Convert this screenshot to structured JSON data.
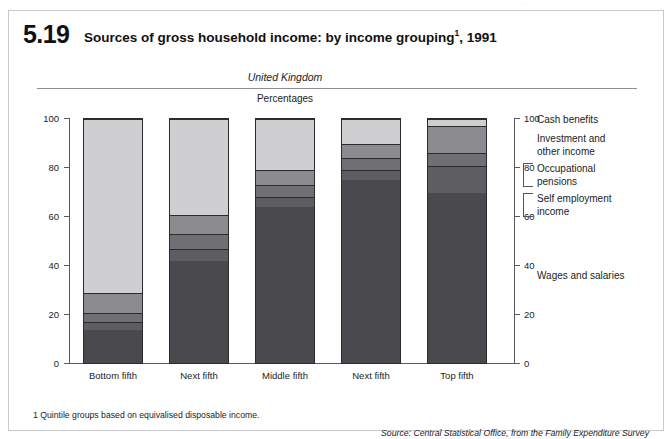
{
  "figure": {
    "number": "5.19",
    "title_main": "Sources of gross household income: by income grouping",
    "title_footnote_marker": "1",
    "title_year": ", 1991",
    "region": "United Kingdom",
    "units": "Percentages",
    "footnote": "1  Quintile groups based on equivalised disposable income.",
    "source": "Source: Central Statistical Office, from the Family Expenditure Survey"
  },
  "legend": {
    "items": [
      {
        "key": "cash_benefits",
        "label": "Cash benefits"
      },
      {
        "key": "investment_other",
        "label": "Investment and\nother income",
        "line1": "Investment and",
        "line2": "other income"
      },
      {
        "key": "occupational_pensions",
        "label": "Occupational\npensions",
        "line1": "Occupational",
        "line2": "pensions"
      },
      {
        "key": "self_employment",
        "label": "Self employment\nincome",
        "line1": "Self employment",
        "line2": "income"
      },
      {
        "key": "wages_salaries",
        "label": "Wages and salaries"
      }
    ]
  },
  "axis": {
    "y_ticks": [
      "0",
      "20",
      "40",
      "60",
      "80",
      "100"
    ],
    "y_min": 0,
    "y_max": 100
  },
  "chart_data": {
    "type": "bar",
    "subtype": "stacked-vertical-100pct",
    "subtitle": "United Kingdom",
    "xlabel": "",
    "ylabel": "Percentages",
    "ylim": [
      0,
      100
    ],
    "yticks": [
      0,
      20,
      40,
      60,
      80,
      100
    ],
    "grid": false,
    "legend_position": "right",
    "categories": [
      "Bottom fifth",
      "Next fifth",
      "Middle fifth",
      "Next fifth",
      "Top fifth"
    ],
    "series": [
      {
        "name": "Wages and salaries",
        "color": "#4a4a4e",
        "values": [
          14,
          42,
          64,
          75,
          70
        ]
      },
      {
        "name": "Self employment income",
        "color": "#5e5e62",
        "values": [
          3,
          5,
          4,
          4,
          11
        ]
      },
      {
        "name": "Occupational pensions",
        "color": "#6f6f74",
        "values": [
          4,
          6,
          5,
          5,
          5
        ]
      },
      {
        "name": "Investment and other income",
        "color": "#8b8b90",
        "values": [
          8,
          8,
          6,
          6,
          11
        ]
      },
      {
        "name": "Cash benefits",
        "color": "#cfcfd2",
        "values": [
          71,
          39,
          21,
          10,
          3
        ]
      }
    ],
    "annotations": [
      "1  Quintile groups based on equivalised disposable income."
    ]
  },
  "colors": {
    "wages_salaries": "#4a4a4e",
    "self_employment": "#5e5e62",
    "occupational_pensions": "#6f6f74",
    "investment_other": "#8b8b90",
    "cash_benefits": "#cfcfd2",
    "axis": "#5a5a5e",
    "border": "#c9c9cd"
  }
}
